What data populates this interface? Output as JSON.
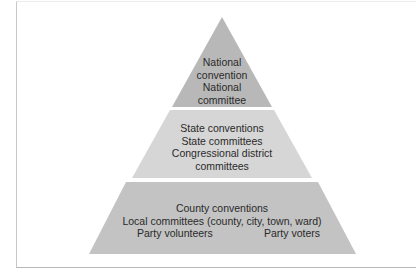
{
  "diagram": {
    "type": "pyramid",
    "colors": {
      "top": "#b8b8b8",
      "middle": "#d6d6d6",
      "bottom": "#c3c3c3",
      "text": "#2a2a2a",
      "frame": "#c8c8c8"
    },
    "tiers": [
      {
        "level": "top",
        "lines": [
          "National",
          "convention",
          "National",
          "committee"
        ]
      },
      {
        "level": "middle",
        "lines": [
          "State conventions",
          "State committees",
          "Congressional district",
          "committees"
        ]
      },
      {
        "level": "bottom",
        "lines": [
          "County conventions",
          "Local committees (county, city, town, ward)"
        ],
        "split_line": [
          "Party volunteers",
          "Party voters"
        ]
      }
    ]
  }
}
